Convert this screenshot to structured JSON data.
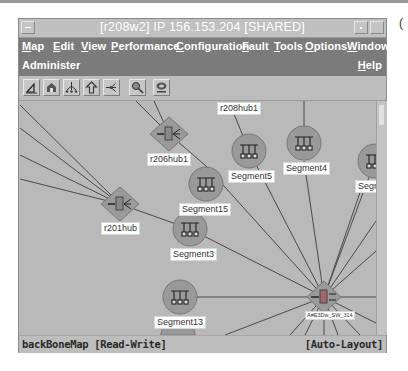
{
  "window": {
    "title": "[r208w2] IP 156.153.204 [SHARED]"
  },
  "menubar": {
    "row1": [
      {
        "label": "Map",
        "mnemonic": "M"
      },
      {
        "label": "Edit",
        "mnemonic": "E"
      },
      {
        "label": "View",
        "mnemonic": "V"
      },
      {
        "label": "Performance",
        "mnemonic": "P"
      },
      {
        "label": "Configuration",
        "mnemonic": "C"
      },
      {
        "label": "Fault",
        "mnemonic": "F"
      },
      {
        "label": "Tools",
        "mnemonic": "T"
      },
      {
        "label": "Options",
        "mnemonic": "O"
      },
      {
        "label": "Window",
        "mnemonic": "W"
      }
    ],
    "row2": [
      {
        "label": "Administer"
      },
      {
        "label": "Help",
        "mnemonic": "H"
      }
    ]
  },
  "toolbar": {
    "buttons": [
      {
        "icon": "triangle-ruler-icon"
      },
      {
        "icon": "home-icon"
      },
      {
        "icon": "network-tree-icon"
      },
      {
        "icon": "up-arrow-icon"
      },
      {
        "icon": "network-connect-icon"
      },
      {
        "icon": "magnifier-icon"
      },
      {
        "icon": "ripple-icon"
      }
    ]
  },
  "map": {
    "nodes": [
      {
        "id": "r208hub1_top",
        "type": "hub",
        "label": "r208hub1"
      },
      {
        "id": "r206hub1",
        "type": "hub",
        "label": "r206hub1"
      },
      {
        "id": "r201hub",
        "type": "hub",
        "label": "r201hub"
      },
      {
        "id": "Segment5",
        "type": "segment",
        "label": "Segment5"
      },
      {
        "id": "Segment4",
        "type": "segment",
        "label": "Segment4"
      },
      {
        "id": "SegmentR",
        "type": "segment",
        "label": "Segme"
      },
      {
        "id": "Segment15",
        "type": "segment",
        "label": "Segment15"
      },
      {
        "id": "Segment3",
        "type": "segment",
        "label": "Segment3"
      },
      {
        "id": "Segment13",
        "type": "segment",
        "label": "Segment13"
      },
      {
        "id": "switch",
        "type": "switch",
        "label": "A#E3Dw_SW_314"
      }
    ],
    "colors": {
      "canvas": "#b9b9b9",
      "node_fill": "#999999",
      "link": "#4a4a4a"
    }
  },
  "statusbar": {
    "map_name": "backBoneMap [Read-Write]",
    "layout_mode": "[Auto-Layout]"
  }
}
